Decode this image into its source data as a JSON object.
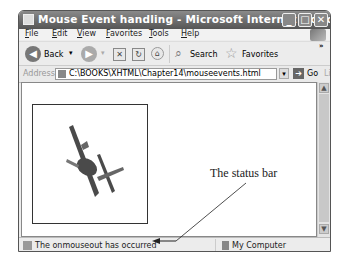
{
  "window": {
    "title": "Mouse Event handling - Microsoft Internet Explore...",
    "controls": {
      "minimize": "_",
      "maximize": "□",
      "close": "✕"
    }
  },
  "menubar": {
    "items": [
      {
        "label": "File"
      },
      {
        "label": "Edit"
      },
      {
        "label": "View"
      },
      {
        "label": "Favorites"
      },
      {
        "label": "Tools"
      },
      {
        "label": "Help"
      }
    ]
  },
  "toolbar": {
    "back_label": "Back",
    "search_label": "Search",
    "favorites_label": "Favorites",
    "overflow": "»"
  },
  "addressbar": {
    "label": "Address",
    "url": "C:\\BOOKS\\XHTML\\Chapter14\\mouseevents.html",
    "go_label": "Go",
    "links_label": "Links"
  },
  "content": {
    "image_alt": "airplane"
  },
  "statusbar": {
    "text": "The onmouseout has occurred",
    "zone": "My Computer"
  },
  "annotation": {
    "label": "The status bar"
  }
}
